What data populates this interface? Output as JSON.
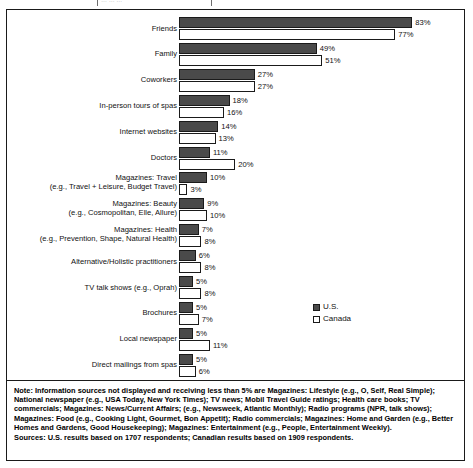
{
  "top_fragment": {
    "text": "… … …"
  },
  "chart_data": {
    "type": "bar",
    "orientation": "horizontal",
    "title": "",
    "subtitle": "",
    "xlabel": "",
    "ylabel": "",
    "xlim": [
      0,
      83
    ],
    "grid": false,
    "value_suffix": "%",
    "legend_position": "middle-right",
    "categories": [
      "Friends",
      "Family",
      "Coworkers",
      "In-person tours of spas",
      "Internet websites",
      "Doctors",
      "Magazines: Travel (e.g., Travel + Leisure, Budget Travel)",
      "Magazines: Beauty (e.g., Cosmopolitan, Elle, Allure)",
      "Magazines: Health (e.g., Prevention, Shape, Natural Health)",
      "Alternative/Holistic practitioners",
      "TV talk shows (e.g., Oprah)",
      "Brochures",
      "Local newspaper",
      "Direct mailings from spas"
    ],
    "series": [
      {
        "name": "U.S.",
        "color": "#4a4a4a",
        "values": [
          83,
          49,
          27,
          18,
          14,
          11,
          10,
          9,
          7,
          6,
          5,
          5,
          5,
          5
        ]
      },
      {
        "name": "Canada",
        "color": "#ffffff",
        "values": [
          77,
          51,
          27,
          16,
          13,
          20,
          3,
          10,
          8,
          8,
          8,
          7,
          11,
          6
        ]
      }
    ]
  },
  "rows": [
    {
      "line1": "Friends",
      "line2": "",
      "us": "83%",
      "ca": "77%"
    },
    {
      "line1": "Family",
      "line2": "",
      "us": "49%",
      "ca": "51%"
    },
    {
      "line1": "Coworkers",
      "line2": "",
      "us": "27%",
      "ca": "27%"
    },
    {
      "line1": "In-person tours of spas",
      "line2": "",
      "us": "18%",
      "ca": "16%"
    },
    {
      "line1": "Internet websites",
      "line2": "",
      "us": "14%",
      "ca": "13%"
    },
    {
      "line1": "Doctors",
      "line2": "",
      "us": "11%",
      "ca": "20%"
    },
    {
      "line1": "Magazines: Travel",
      "line2": "(e.g., Travel + Leisure, Budget Travel)",
      "us": "10%",
      "ca": "3%"
    },
    {
      "line1": "Magazines: Beauty",
      "line2": "(e.g., Cosmopolitan, Elle, Allure)",
      "us": "9%",
      "ca": "10%"
    },
    {
      "line1": "Magazines: Health",
      "line2": "(e.g., Prevention, Shape, Natural Health)",
      "us": "7%",
      "ca": "8%"
    },
    {
      "line1": "Alternative/Holistic practitioners",
      "line2": "",
      "us": "6%",
      "ca": "8%"
    },
    {
      "line1": "TV talk shows (e.g., Oprah)",
      "line2": "",
      "us": "5%",
      "ca": "8%"
    },
    {
      "line1": "Brochures",
      "line2": "",
      "us": "5%",
      "ca": "7%"
    },
    {
      "line1": "Local newspaper",
      "line2": "",
      "us": "5%",
      "ca": "11%"
    },
    {
      "line1": "Direct mailings from spas",
      "line2": "",
      "us": "5%",
      "ca": "6%"
    }
  ],
  "legend": {
    "items": [
      {
        "label": "U.S.",
        "color": "#4a4a4a"
      },
      {
        "label": "Canada",
        "color": "#ffffff"
      }
    ]
  },
  "note": {
    "body": "Note: Information sources not displayed and receiving less than 5% are Magazines: Lifestyle (e.g., O, Self, Real Simple); National newspaper (e.g., USA Today, New York Times); TV news; Mobil Travel Guide ratings; Health care books; TV commercials; Magazines: News/Current Affairs; (e.g., Newsweek, Atlantic Monthly); Radio programs (NPR, talk shows); Magazines: Food (e.g., Cooking Light, Gourmet, Bon Appetit); Radio commercials; Magazines: Home and Garden (e.g., Better Homes and Gardens, Good Housekeeping); Magazines: Entertainment (e.g., People, Entertainment Weekly).",
    "sources": "Sources: U.S. results based on 1707 respondents; Canadian results based on 1909 respondents."
  }
}
